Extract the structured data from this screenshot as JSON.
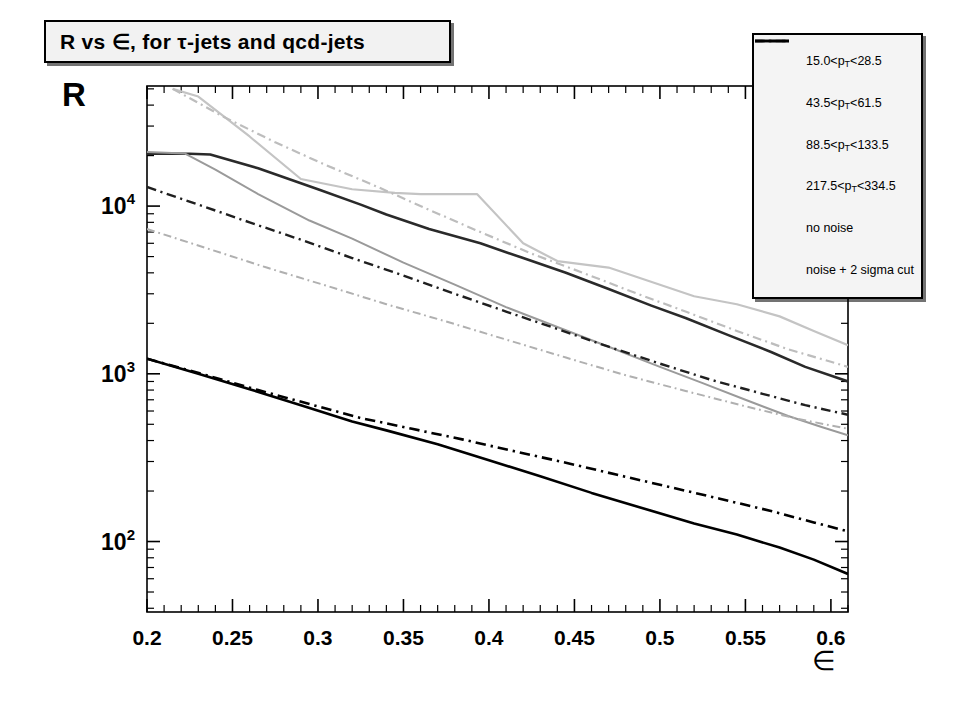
{
  "title": {
    "text": "R vs ∈, for τ-jets and qcd-jets"
  },
  "axes": {
    "y_title": "R",
    "x_title": "∈",
    "x_ticklabels": [
      "0.2",
      "0.25",
      "0.3",
      "0.35",
      "0.4",
      "0.45",
      "0.5",
      "0.55",
      "0.6"
    ],
    "y_ticklabels": [
      "10²",
      "10³",
      "10⁴"
    ]
  },
  "legend": {
    "items": [
      {
        "label": "15.0<pₜ<28.5",
        "style": "dashed",
        "color": "#1a1a1a",
        "name": "legend-pt-15-28"
      },
      {
        "label": "43.5<pₜ<61.5",
        "style": "solid",
        "color": "#9a9a9a",
        "name": "legend-pt-43-61"
      },
      {
        "label": "88.5<pₜ<133.5",
        "style": "solid",
        "color": "#1a1a1a",
        "name": "legend-pt-88-133"
      },
      {
        "label": "217.5<pₜ<334.5",
        "style": "solid",
        "color": "#c9c9c9",
        "name": "legend-pt-217-334"
      },
      {
        "label": "no noise",
        "style": "solid",
        "color": "#000000",
        "name": "legend-no-noise"
      },
      {
        "label": "noise + 2 sigma cut",
        "style": "dashdot",
        "color": "#000000",
        "name": "legend-noise-2sigma"
      }
    ]
  },
  "chart_data": {
    "type": "line",
    "title": "R vs ∈, for τ-jets and qcd-jets",
    "xlabel": "∈",
    "ylabel": "R",
    "xlim": [
      0.2,
      0.61
    ],
    "ylim": [
      38,
      52000
    ],
    "yscale": "log",
    "grid": false,
    "legend_position": "top-right",
    "x_major_ticks": [
      0.2,
      0.25,
      0.3,
      0.35,
      0.4,
      0.45,
      0.5,
      0.55,
      0.6
    ],
    "x_minor_step": 0.01,
    "series": [
      {
        "name": "88.5<p_T<133.5 no noise",
        "pt_range": "88.5<pₜ<133.5",
        "noise": "no noise",
        "style": "solid",
        "color": "#2a2a2a",
        "width": 2.6,
        "x": [
          0.2,
          0.225,
          0.237,
          0.265,
          0.3,
          0.325,
          0.34,
          0.365,
          0.395,
          0.42,
          0.445,
          0.47,
          0.495,
          0.515,
          0.54,
          0.565,
          0.585,
          0.61
        ],
        "y": [
          20500,
          20500,
          20300,
          16800,
          12600,
          10200,
          8900,
          7300,
          6000,
          4900,
          4000,
          3200,
          2550,
          2150,
          1700,
          1350,
          1100,
          900
        ]
      },
      {
        "name": "43.5<p_T<61.5 no noise",
        "pt_range": "43.5<pₜ<61.5",
        "noise": "no noise",
        "style": "solid",
        "color": "#9a9a9a",
        "width": 2.0,
        "x": [
          0.2,
          0.222,
          0.24,
          0.265,
          0.295,
          0.32,
          0.35,
          0.38,
          0.41,
          0.44,
          0.47,
          0.5,
          0.525,
          0.55,
          0.575,
          0.595,
          0.61
        ],
        "y": [
          21000,
          20600,
          16500,
          11800,
          8200,
          6400,
          4600,
          3400,
          2500,
          1900,
          1450,
          1100,
          880,
          700,
          560,
          480,
          430
        ]
      },
      {
        "name": "217.5<p_T<334.5 no noise",
        "pt_range": "217.5<pₜ<334.5",
        "noise": "no noise",
        "style": "solid",
        "color": "#c4c4c4",
        "width": 2.2,
        "x": [
          0.215,
          0.23,
          0.26,
          0.29,
          0.32,
          0.345,
          0.36,
          0.393,
          0.42,
          0.44,
          0.47,
          0.5,
          0.52,
          0.545,
          0.57,
          0.59,
          0.61
        ],
        "y": [
          50000,
          45000,
          26000,
          14500,
          12600,
          12000,
          11800,
          11800,
          6000,
          4700,
          4300,
          3400,
          2900,
          2600,
          2200,
          1800,
          1480
        ]
      },
      {
        "name": "15.0<p_T<28.5 noise + 2 sigma cut",
        "pt_range": "15.0<pₜ<28.5",
        "noise": "noise + 2 sigma cut",
        "style": "dashdot",
        "color": "#1f1f1f",
        "width": 2.4,
        "x": [
          0.2,
          0.23,
          0.26,
          0.29,
          0.32,
          0.35,
          0.38,
          0.41,
          0.44,
          0.47,
          0.5,
          0.53,
          0.56,
          0.585,
          0.61
        ],
        "y": [
          13000,
          10200,
          8000,
          6300,
          4900,
          3850,
          3000,
          2350,
          1850,
          1450,
          1150,
          920,
          760,
          650,
          570
        ]
      },
      {
        "name": "217.5<p_T<334.5 noise + 2 sigma cut",
        "pt_range": "217.5<pₜ<334.5",
        "noise": "noise + 2 sigma cut",
        "style": "dashdot",
        "color": "#bdbdbd",
        "width": 2.2,
        "x": [
          0.215,
          0.245,
          0.275,
          0.305,
          0.335,
          0.365,
          0.395,
          0.425,
          0.455,
          0.485,
          0.515,
          0.545,
          0.575,
          0.6,
          0.61
        ],
        "y": [
          50000,
          34000,
          24000,
          17500,
          13000,
          9500,
          7000,
          5200,
          4000,
          3050,
          2350,
          1800,
          1400,
          1180,
          1100
        ]
      },
      {
        "name": "43.5<p_T<61.5 noise + 2 sigma cut",
        "pt_range": "43.5<pₜ<61.5",
        "noise": "noise + 2 sigma cut",
        "style": "dashdot",
        "color": "#b0b0b0",
        "width": 2.0,
        "x": [
          0.2,
          0.235,
          0.27,
          0.305,
          0.34,
          0.375,
          0.41,
          0.445,
          0.48,
          0.515,
          0.55,
          0.58,
          0.61
        ],
        "y": [
          7300,
          5600,
          4300,
          3350,
          2600,
          2050,
          1600,
          1250,
          980,
          790,
          640,
          540,
          470
        ]
      },
      {
        "name": "qcd no noise",
        "pt_range": "",
        "noise": "no noise",
        "style": "solid",
        "color": "#000000",
        "width": 2.6,
        "x": [
          0.2,
          0.23,
          0.26,
          0.29,
          0.32,
          0.34,
          0.37,
          0.4,
          0.43,
          0.46,
          0.49,
          0.52,
          0.545,
          0.57,
          0.59,
          0.61
        ],
        "y": [
          1230,
          1000,
          810,
          650,
          520,
          460,
          380,
          305,
          245,
          195,
          158,
          128,
          110,
          92,
          78,
          64
        ]
      },
      {
        "name": "qcd noise + 2 sigma cut",
        "pt_range": "",
        "noise": "noise + 2 sigma cut",
        "style": "dashdot",
        "color": "#000000",
        "width": 2.6,
        "x": [
          0.2,
          0.235,
          0.265,
          0.295,
          0.325,
          0.355,
          0.385,
          0.415,
          0.445,
          0.475,
          0.505,
          0.535,
          0.565,
          0.59,
          0.61
        ],
        "y": [
          1230,
          980,
          800,
          660,
          545,
          470,
          405,
          345,
          295,
          250,
          212,
          180,
          152,
          130,
          115
        ]
      }
    ]
  }
}
